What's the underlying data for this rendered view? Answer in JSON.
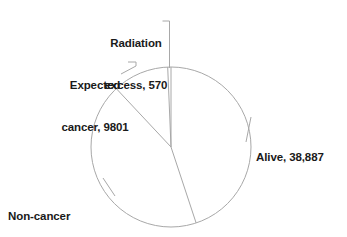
{
  "chart_data": {
    "type": "pie",
    "title": "",
    "subtitle": "",
    "xlabel": "",
    "ylabel": "",
    "legend_position": "none",
    "grid": false,
    "total": 86575,
    "start_angle_deg": 0,
    "direction": "clockwise",
    "categories": [
      "Alive",
      "Non-cancer deaths",
      "Expected cancer",
      "Radiation excess"
    ],
    "values": [
      38887,
      37317,
      9801,
      570
    ],
    "slices": [
      {
        "name": "Alive",
        "value": 38887,
        "value_label": "38,887",
        "label": "Alive, 38,887",
        "angle_deg": 161.7,
        "percent": 44.9
      },
      {
        "name": "Non-cancer deaths",
        "value": 37317,
        "value_label": "37,317",
        "label": "Non-cancer deaths, 37,317",
        "angle_deg": 155.2,
        "percent": 43.1
      },
      {
        "name": "Expected cancer",
        "value": 9801,
        "value_label": "9801",
        "label": "Expected cancer, 9801",
        "angle_deg": 40.8,
        "percent": 11.3
      },
      {
        "name": "Radiation excess",
        "value": 570,
        "value_label": "570",
        "label": "Radiation excess, 570",
        "angle_deg": 2.4,
        "percent": 0.7
      }
    ],
    "colors": {
      "background": "#ffffff",
      "outline": "#a8a8a8",
      "leader": "#a8a8a8",
      "text": "#1a1a1a"
    }
  },
  "labels": {
    "radiation": {
      "line1": "Radiation",
      "line2": "excess, 570"
    },
    "expected": {
      "line1": "Expected",
      "line2": "cancer, 9801"
    },
    "alive": {
      "line1": "Alive, 38,887"
    },
    "noncancer": {
      "line1": "Non-cancer",
      "line2": "deaths, 37,317"
    }
  }
}
